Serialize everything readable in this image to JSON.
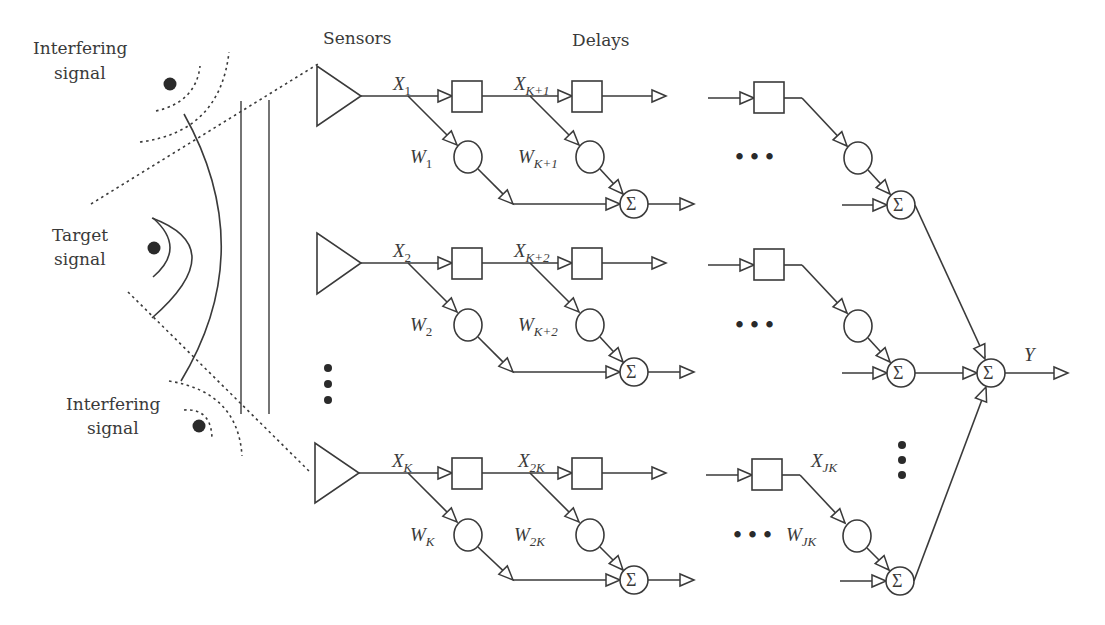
{
  "diagram": {
    "type": "broadband beamformer (tapped delay line array)",
    "colors": {
      "stroke": "#3a3a3a",
      "text": "#3a3a3a",
      "background": "#ffffff",
      "dots": "#2a2a2a"
    },
    "labels": {
      "interfering_top_line1": "Interfering",
      "interfering_top_line2": "signal",
      "target_line1": "Target",
      "target_line2": "signal",
      "interfering_bottom_line1": "Interfering",
      "interfering_bottom_line2": "signal",
      "sensors": "Sensors",
      "delays": "Delays",
      "output": "Y",
      "sum_symbol": "Σ"
    },
    "rows": [
      {
        "sensor": "sensor-1",
        "taps": [
          {
            "x_base": "X",
            "x_sub": "1",
            "w_base": "W",
            "w_sub": "1"
          },
          {
            "x_base": "X",
            "x_sub": "K+1",
            "w_base": "W",
            "w_sub": "K+1"
          }
        ]
      },
      {
        "sensor": "sensor-2",
        "taps": [
          {
            "x_base": "X",
            "x_sub": "2",
            "w_base": "W",
            "w_sub": "2"
          },
          {
            "x_base": "X",
            "x_sub": "K+2",
            "w_base": "W",
            "w_sub": "K+2"
          }
        ]
      },
      {
        "sensor": "sensor-K",
        "taps": [
          {
            "x_base": "X",
            "x_sub": "K",
            "w_base": "W",
            "w_sub": "K"
          },
          {
            "x_base": "X",
            "x_sub": "2K",
            "w_base": "W",
            "w_sub": "2K"
          }
        ],
        "last_tap": {
          "x_base": "X",
          "x_sub": "JK",
          "w_base": "W",
          "w_sub": "JK"
        }
      }
    ],
    "ellipsis": "•••"
  }
}
